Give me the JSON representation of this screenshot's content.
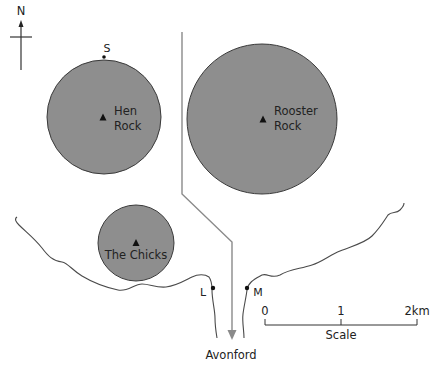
{
  "map": {
    "colors": {
      "island_fill": "#8e8e8e",
      "island_stroke": "#3a3a3a",
      "road": "#8a8a8a",
      "coast": "#4a4a4a",
      "text": "#222222"
    },
    "north_arrow": {
      "label": "N"
    },
    "points": {
      "s": {
        "label": "S"
      },
      "l": {
        "label": "L"
      },
      "m": {
        "label": "M"
      }
    },
    "islands": [
      {
        "name": "Hen Rock",
        "line1": "Hen",
        "line2": "Rock"
      },
      {
        "name": "Rooster Rock",
        "line1": "Rooster",
        "line2": "Rock"
      },
      {
        "name": "The Chicks",
        "line1": "The Chicks"
      }
    ],
    "town": {
      "label": "Avonford"
    },
    "scale": {
      "title": "Scale",
      "ticks": [
        "0",
        "1",
        "2km"
      ]
    }
  }
}
